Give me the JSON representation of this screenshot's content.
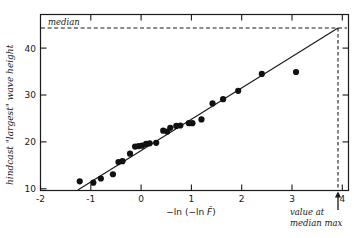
{
  "chart_data": {
    "type": "scatter",
    "title": "",
    "xlabel": "-ln (-ln F̂)",
    "ylabel": "hindcast \"largest\" wave height",
    "xlim": [
      -2,
      4.35
    ],
    "ylim": [
      9,
      45
    ],
    "grid": false,
    "legend": null,
    "xticks": [
      -2,
      -1,
      0,
      1,
      2,
      3,
      4
    ],
    "xtick_labels": [
      "-2",
      "-1",
      "0",
      "1",
      "2",
      "3",
      "4"
    ],
    "yticks": [
      10,
      20,
      30,
      40
    ],
    "ytick_labels": [
      "10",
      "20",
      "30",
      "40"
    ],
    "points": [
      {
        "x": -1.22,
        "y": 11.6
      },
      {
        "x": -0.95,
        "y": 11.3
      },
      {
        "x": -0.8,
        "y": 12.2
      },
      {
        "x": -0.56,
        "y": 13.1
      },
      {
        "x": -0.45,
        "y": 15.7
      },
      {
        "x": -0.37,
        "y": 15.9
      },
      {
        "x": -0.22,
        "y": 17.5
      },
      {
        "x": -0.12,
        "y": 19.0
      },
      {
        "x": -0.05,
        "y": 19.1
      },
      {
        "x": 0.02,
        "y": 19.2
      },
      {
        "x": 0.1,
        "y": 19.6
      },
      {
        "x": 0.17,
        "y": 19.7
      },
      {
        "x": 0.3,
        "y": 19.8
      },
      {
        "x": 0.44,
        "y": 22.4
      },
      {
        "x": 0.52,
        "y": 22.2
      },
      {
        "x": 0.58,
        "y": 23.0
      },
      {
        "x": 0.7,
        "y": 23.4
      },
      {
        "x": 0.78,
        "y": 23.5
      },
      {
        "x": 0.95,
        "y": 24.0
      },
      {
        "x": 1.02,
        "y": 24.0
      },
      {
        "x": 1.2,
        "y": 24.8
      },
      {
        "x": 1.42,
        "y": 28.2
      },
      {
        "x": 1.63,
        "y": 29.1
      },
      {
        "x": 1.93,
        "y": 30.9
      },
      {
        "x": 2.4,
        "y": 34.5
      },
      {
        "x": 3.08,
        "y": 34.9
      }
    ],
    "fit_line": {
      "x0": -1.25,
      "y0": 10.2,
      "x1": 4.12,
      "y1": 43.3
    },
    "median_line": {
      "y": 43.3,
      "label": "median"
    },
    "median_max_marker": {
      "x": 4.12,
      "label": "value at median max"
    },
    "series_name": "hindcast largest wave height"
  },
  "annotations": {
    "median_label": "median",
    "value_at_median_max_line1": "value at",
    "value_at_median_max_line2": "median max"
  },
  "footer": {
    "cut_text": ""
  }
}
